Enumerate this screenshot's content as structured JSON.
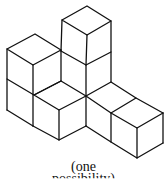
{
  "figure": {
    "cube_count_visible": 9,
    "stroke_color": "#111111",
    "background": "#ffffff"
  },
  "caption": {
    "line1": "(one",
    "line2": "possibility)"
  }
}
